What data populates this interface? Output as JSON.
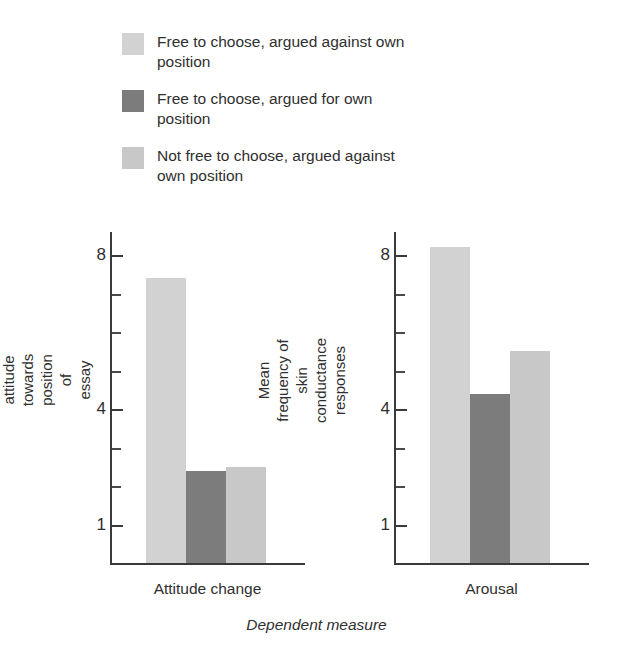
{
  "legend": {
    "items": [
      {
        "label": "Free to choose, argued against own position",
        "color": "#d2d2d2"
      },
      {
        "label": "Free to choose, argued for own position",
        "color": "#7c7c7c"
      },
      {
        "label": "Not free to choose, argued against own position",
        "color": "#c8c8c8"
      }
    ]
  },
  "xlabel": "Dependent measure",
  "chart_data": {
    "type": "bar",
    "title": "",
    "xlabel": "Dependent measure",
    "legend_position": "top-left",
    "grid": false,
    "series": [
      {
        "name": "Free to choose, argued against own position",
        "color": "#d2d2d2",
        "values": [
          7.4,
          8.2
        ]
      },
      {
        "name": "Free to choose, argued for own position",
        "color": "#7c7c7c",
        "values": [
          2.4,
          4.4
        ]
      },
      {
        "name": "Not free to choose, argued against own position",
        "color": "#c8c8c8",
        "values": [
          2.5,
          5.5
        ]
      }
    ],
    "panels": [
      {
        "category": "Attitude change",
        "ylabel": "Mean change in attitude towards position of essay",
        "ylim": [
          0,
          8.6
        ],
        "ticklabels": [
          "8",
          "4",
          "1"
        ],
        "tickvalues": [
          8,
          4,
          1
        ],
        "minor_ticks": [
          7,
          6,
          5,
          3,
          2
        ],
        "values": [
          7.4,
          2.4,
          2.5
        ]
      },
      {
        "category": "Arousal",
        "ylabel": "Mean frequency of skin conductance responses",
        "ylim": [
          0,
          8.6
        ],
        "ticklabels": [
          "8",
          "4",
          "1"
        ],
        "tickvalues": [
          8,
          4,
          1
        ],
        "minor_ticks": [
          7,
          6,
          5,
          3,
          2
        ],
        "values": [
          8.2,
          4.4,
          5.5
        ]
      }
    ]
  }
}
